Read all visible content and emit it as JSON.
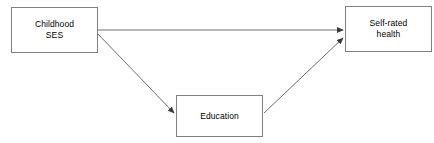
{
  "diagram": {
    "background_color": "#ffffff",
    "line_color": "#6e6e6e",
    "border_color": "#808080",
    "text_color": "#000000",
    "width": 434,
    "height": 143,
    "nodes": [
      {
        "id": "childhood-ses",
        "label": "Childhood\nSES",
        "x": 11,
        "y": 7,
        "width": 87,
        "height": 46
      },
      {
        "id": "self-rated-health",
        "label": "Self-rated\nhealth",
        "x": 345,
        "y": 6,
        "width": 87,
        "height": 46
      },
      {
        "id": "education",
        "label": "Education",
        "x": 176,
        "y": 95,
        "width": 87,
        "height": 42
      }
    ],
    "edges": [
      {
        "id": "ses-to-health",
        "from": "childhood-ses",
        "to": "self-rated-health",
        "label": "",
        "style": "solid-arrow",
        "x1": 98,
        "y1": 30,
        "x2": 343,
        "y2": 30
      },
      {
        "id": "ses-to-education",
        "from": "childhood-ses",
        "to": "education",
        "label": "",
        "style": "solid-arrow",
        "x1": 98,
        "y1": 34,
        "x2": 174,
        "y2": 113
      },
      {
        "id": "education-to-health",
        "from": "education",
        "to": "self-rated-health",
        "label": "",
        "style": "solid-arrow",
        "x1": 264,
        "y1": 113,
        "x2": 343,
        "y2": 38
      }
    ]
  }
}
